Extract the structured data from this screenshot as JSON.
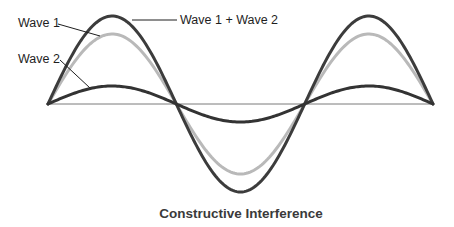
{
  "title": "Constructive Interference",
  "labels": {
    "wave1": "Wave 1",
    "wave2": "Wave 2",
    "sum": "Wave 1 + Wave 2"
  },
  "colors": {
    "wave1": "#b9b9b9",
    "wave2": "#333333",
    "sum": "#3c3c3c",
    "axis": "#7a7a7a",
    "text": "#1e1e1e"
  },
  "chart_data": {
    "type": "line",
    "title": "Constructive Interference",
    "xlabel": "",
    "ylabel": "",
    "cycles": 1.5,
    "series": [
      {
        "name": "Wave 1",
        "amplitude": 70,
        "phase": 0,
        "color": "#b9b9b9"
      },
      {
        "name": "Wave 2",
        "amplitude": 18,
        "phase": 0,
        "color": "#333333"
      },
      {
        "name": "Wave 1 + Wave 2",
        "amplitude": 88,
        "phase": 0,
        "color": "#3c3c3c"
      }
    ],
    "grid": false,
    "legend": "inline leader-line labels"
  }
}
